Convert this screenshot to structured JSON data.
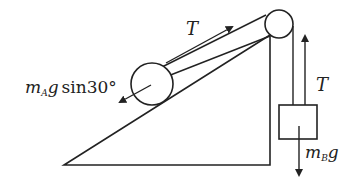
{
  "diagram": {
    "colors": {
      "stroke": "#222222",
      "background": "#ffffff"
    },
    "labels": {
      "tension_incline": "T",
      "tension_vertical": "T",
      "force_A_main": "m",
      "force_A_sub": "A",
      "force_A_g": "g",
      "force_A_tail": "sin30°",
      "force_B_main": "m",
      "force_B_sub": "B",
      "force_B_g": "g"
    },
    "incline_angle_deg": 30
  }
}
